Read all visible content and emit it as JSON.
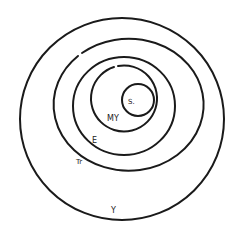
{
  "diagram": {
    "background": "#ffffff",
    "stroke_color": "#1a1a1a",
    "rings": [
      {
        "id": "Y",
        "label": "Y",
        "cx": 122,
        "cy": 119,
        "rx": 102,
        "ry": 101
      },
      {
        "id": "Tr",
        "label": "Tr",
        "cx": 117,
        "cy": 111,
        "rx": 75,
        "ry": 66
      },
      {
        "id": "E",
        "label": "E",
        "cx": 124,
        "cy": 106,
        "rx": 51,
        "ry": 49
      },
      {
        "id": "MY",
        "label": "MY",
        "cx": 126,
        "cy": 98,
        "rx": 33,
        "ry": 33
      },
      {
        "id": "S",
        "label": "S.",
        "cx": 138,
        "cy": 100,
        "rx": 16,
        "ry": 16
      }
    ],
    "labels": {
      "s": "S.",
      "my": "MY",
      "e": "E",
      "tr": "Tr",
      "y": "Y"
    }
  }
}
